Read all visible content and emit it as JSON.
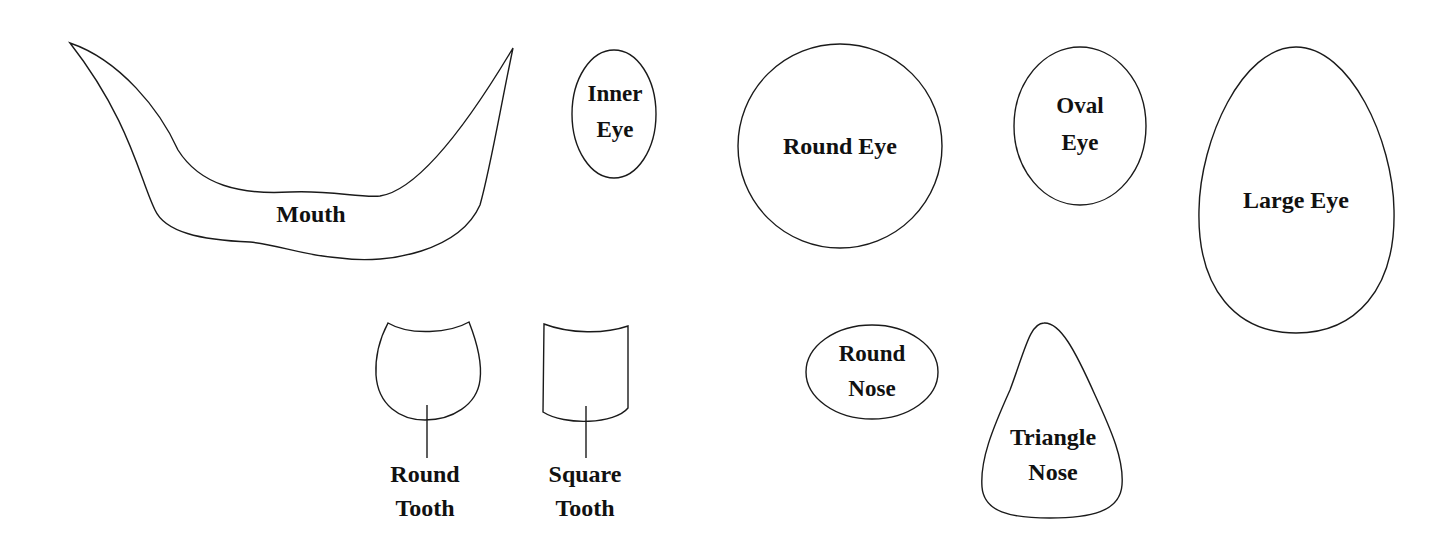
{
  "template": {
    "style": {
      "background": "#ffffff",
      "stroke_color": "#1a1a1a",
      "text_color": "#111111"
    },
    "shapes": {
      "mouth": {
        "label": "Mouth"
      },
      "inner_eye": {
        "label_lines": [
          "Inner",
          "Eye"
        ]
      },
      "round_eye": {
        "label": "Round Eye"
      },
      "oval_eye": {
        "label_lines": [
          "Oval",
          "Eye"
        ]
      },
      "large_eye": {
        "label": "Large Eye"
      },
      "round_tooth": {
        "label_lines": [
          "Round",
          "Tooth"
        ]
      },
      "square_tooth": {
        "label_lines": [
          "Square",
          "Tooth"
        ]
      },
      "round_nose": {
        "label_lines": [
          "Round",
          "Nose"
        ]
      },
      "triangle_nose": {
        "label_lines": [
          "Triangle",
          "Nose"
        ]
      }
    }
  }
}
